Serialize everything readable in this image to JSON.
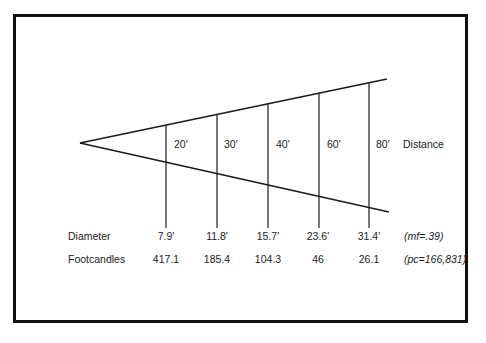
{
  "diagram": {
    "distance_label": "Distance",
    "distances": [
      "20'",
      "30'",
      "40'",
      "60'",
      "80'"
    ],
    "rows": [
      {
        "label": "Diameter",
        "values": [
          "7.9'",
          "11.8'",
          "15.7'",
          "23.6'",
          "31.4'"
        ],
        "note": "(mf=.39)"
      },
      {
        "label": "Footcandles",
        "values": [
          "417.1",
          "185.4",
          "104.3",
          "46",
          "26.1"
        ],
        "note": "(pc=166,831)"
      }
    ],
    "colors": {
      "line": "#1a1a1a",
      "frame": "#111111",
      "background": "#ffffff"
    }
  }
}
